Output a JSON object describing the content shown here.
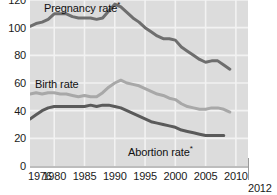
{
  "chart_data": {
    "type": "line",
    "title": "",
    "subtitle": "",
    "xlabel": "",
    "ylabel": "",
    "xlim": [
      1976,
      2012
    ],
    "ylim": [
      0,
      120
    ],
    "grid": true,
    "grid_color": "#f2f2f2",
    "plot_background": "#dcdcdc",
    "legend_position": "inline-labels",
    "y_ticks": [
      0,
      20,
      40,
      60,
      80,
      100,
      120
    ],
    "y_tick_labels": [
      "0",
      "20",
      "40",
      "60",
      "80",
      "100",
      "120"
    ],
    "x_ticks": [
      1976,
      1980,
      1985,
      1990,
      1995,
      2000,
      2005,
      2010
    ],
    "x_tick_labels": [
      "1976",
      "1980",
      "1985",
      "1990",
      "1995",
      "2000",
      "2005",
      "2010"
    ],
    "x_axis_end_label": "2012",
    "annotations": [
      {
        "text": "Pregnancy rate",
        "superscript": "*",
        "series": "Pregnancy rate"
      },
      {
        "text": "Birth rate",
        "superscript": "",
        "series": "Birth rate"
      },
      {
        "text": "Abortion rate",
        "superscript": "*",
        "series": "Abortion rate"
      }
    ],
    "series": [
      {
        "name": "Pregnancy rate",
        "color": "#6e6e6e",
        "x": [
          1976,
          1977,
          1978,
          1979,
          1980,
          1981,
          1982,
          1983,
          1984,
          1985,
          1986,
          1987,
          1988,
          1989,
          1990,
          1991,
          1992,
          1993,
          1994,
          1995,
          1996,
          1997,
          1998,
          1999,
          2000,
          2001,
          2002,
          2003,
          2004,
          2005,
          2006,
          2007,
          2008,
          2009
        ],
        "values": [
          101,
          103,
          104,
          106,
          110,
          110,
          110,
          108,
          107,
          107,
          107,
          106,
          107,
          112,
          117,
          115,
          111,
          107,
          104,
          100,
          97,
          94,
          92,
          92,
          91,
          86,
          83,
          80,
          77,
          75,
          76,
          76,
          73,
          70
        ]
      },
      {
        "name": "Birth rate",
        "color": "#a8a8a8",
        "x": [
          1976,
          1977,
          1978,
          1979,
          1980,
          1981,
          1982,
          1983,
          1984,
          1985,
          1986,
          1987,
          1988,
          1989,
          1990,
          1991,
          1992,
          1993,
          1994,
          1995,
          1996,
          1997,
          1998,
          1999,
          2000,
          2001,
          2002,
          2003,
          2004,
          2005,
          2006,
          2007,
          2008,
          2009
        ],
        "values": [
          52,
          53,
          52,
          53,
          53,
          52,
          52,
          51,
          50,
          51,
          50,
          50,
          53,
          57,
          60,
          62,
          60,
          59,
          58,
          56,
          54,
          52,
          51,
          49,
          48,
          45,
          43,
          42,
          41,
          41,
          42,
          42,
          41,
          39
        ]
      },
      {
        "name": "Abortion rate",
        "color": "#5a5a5a",
        "x": [
          1976,
          1977,
          1978,
          1979,
          1980,
          1981,
          1982,
          1983,
          1984,
          1985,
          1986,
          1987,
          1988,
          1989,
          1990,
          1991,
          1992,
          1993,
          1994,
          1995,
          1996,
          1997,
          1998,
          1999,
          2000,
          2001,
          2002,
          2003,
          2004,
          2005,
          2006,
          2007,
          2008
        ],
        "values": [
          34,
          37,
          40,
          42,
          43,
          43,
          43,
          43,
          43,
          43,
          44,
          43,
          44,
          44,
          43,
          42,
          40,
          38,
          36,
          34,
          32,
          31,
          30,
          29,
          28,
          26,
          25,
          24,
          23,
          22,
          22,
          22,
          22
        ]
      }
    ]
  }
}
